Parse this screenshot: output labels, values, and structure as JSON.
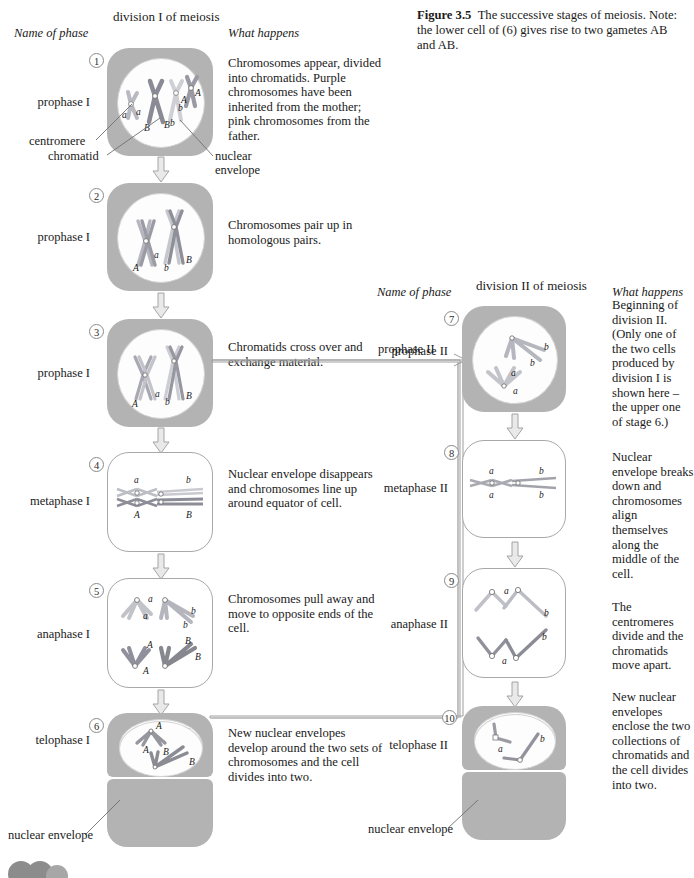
{
  "figure": {
    "label": "Figure 3.5",
    "caption": "The successive stages of meiosis. Note: the lower cell of (6) gives rise to two gametes AB and AB."
  },
  "columns": {
    "left": {
      "name_header": "Name of phase",
      "division_header": "division I of meiosis",
      "what_header": "What happens"
    },
    "right": {
      "name_header": "Name of phase",
      "division_header": "division II of meiosis",
      "what_header": "What happens"
    }
  },
  "annotations": {
    "centromere": "centromere",
    "chromatid": "chromatid",
    "nuclear_envelope_top": "nuclear",
    "nuclear_envelope_top2": "envelope",
    "nuclear_envelope_left": "nuclear envelope",
    "nuclear_envelope_right": "nuclear envelope",
    "prophase_II_connector": "prophase II"
  },
  "colors": {
    "cytoplasm": "#b3b3b3",
    "nucleus": "#fdfdfd",
    "chromosome_maternal": "#8e8e9c",
    "chromosome_paternal": "#d8d8dc",
    "outline": "#6f6f6f",
    "text": "#1a1a1a"
  },
  "stages": [
    {
      "number": "1",
      "phase": "prophase I",
      "description": "Chromosomes appear, divided into chromatids. Purple chromosomes have been inherited from the mother; pink chromosomes from the father.",
      "has_envelope": true,
      "column": "left"
    },
    {
      "number": "2",
      "phase": "prophase I",
      "description": "Chromosomes pair up in homologous pairs.",
      "has_envelope": true,
      "column": "left"
    },
    {
      "number": "3",
      "phase": "prophase I",
      "description": "Chromatids cross over and exchange material.",
      "has_envelope": true,
      "column": "left"
    },
    {
      "number": "4",
      "phase": "metaphase I",
      "description": "Nuclear envelope disappears and chromosomes line up around equator of cell.",
      "has_envelope": false,
      "column": "left"
    },
    {
      "number": "5",
      "phase": "anaphase I",
      "description": "Chromosomes pull away and move to opposite ends of the cell.",
      "has_envelope": false,
      "column": "left"
    },
    {
      "number": "6",
      "phase": "telophase I",
      "description": "New nuclear envelopes develop around the two sets of chromosomes and the cell divides into two.",
      "has_envelope": true,
      "column": "left"
    },
    {
      "number": "7",
      "phase": "prophase II",
      "description": "Beginning of division II. (Only one of the two cells produced by division I is shown here – the upper one of stage 6.)",
      "has_envelope": true,
      "column": "right"
    },
    {
      "number": "8",
      "phase": "metaphase II",
      "description": "Nuclear envelope breaks down and chromosomes align themselves along the middle of the cell.",
      "has_envelope": false,
      "column": "right"
    },
    {
      "number": "9",
      "phase": "anaphase II",
      "description": "The centromeres divide and the chromatids move apart.",
      "has_envelope": false,
      "column": "right"
    },
    {
      "number": "10",
      "phase": "telophase II",
      "description": "New nuclear envelopes enclose the two collections of chromatids and the cell divides into two.",
      "has_envelope": true,
      "column": "right"
    }
  ],
  "chromosome_labels": {
    "stage1": [
      "a",
      "a",
      "B",
      "B",
      "A",
      "A",
      "b",
      "b"
    ],
    "stage2": [
      "A",
      "a",
      "b",
      "B"
    ],
    "stage3": [
      "A",
      "a",
      "b",
      "B"
    ],
    "stage4": [
      "a",
      "A",
      "b",
      "B"
    ],
    "stage5": [
      "a",
      "a",
      "b",
      "b",
      "A",
      "A",
      "B",
      "B"
    ],
    "stage6": [
      "b",
      "b",
      "a",
      "a",
      "A",
      "A",
      "B",
      "B"
    ],
    "stage7": [
      "b",
      "b",
      "a",
      "a"
    ],
    "stage8": [
      "a",
      "a",
      "b",
      "b"
    ],
    "stage9": [
      "a",
      "b",
      "a",
      "b"
    ],
    "stage10": [
      "a",
      "b",
      "a",
      "b"
    ]
  }
}
